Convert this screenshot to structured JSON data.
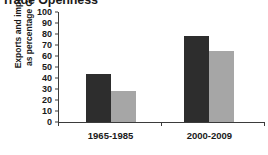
{
  "chart_data": {
    "type": "bar",
    "title": "Trade Openness",
    "xlabel": "",
    "ylabel": "Exports and imports as percentage GDP",
    "ylabel_lines": [
      "Exports and imports",
      "as percentage GDP"
    ],
    "categories": [
      "1965-1985",
      "2000-2009"
    ],
    "series": [
      {
        "name": "dark-series",
        "color": "#2d2d2d",
        "values": [
          44,
          78
        ]
      },
      {
        "name": "gray-series",
        "color": "#a6a6a6",
        "values": [
          28,
          65
        ]
      }
    ],
    "ylim": [
      0,
      100
    ],
    "ytick_step": 10,
    "yticks": [
      100,
      90,
      80,
      70,
      60,
      50,
      40,
      30,
      20,
      10,
      0
    ],
    "ytick_labels": [
      "100",
      "90",
      "80",
      "70",
      "60",
      "50",
      "40",
      "30",
      "20",
      "10",
      "0"
    ],
    "grid": false,
    "legend": "none",
    "axis_color": "#3b3b3b",
    "background": "#ffffff"
  }
}
